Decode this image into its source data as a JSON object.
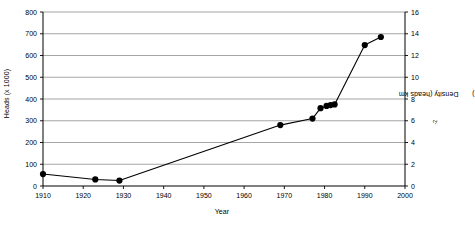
{
  "chart_data": {
    "type": "line",
    "title": "",
    "xlabel": "Year",
    "ylabel": "Heads (x 1000)",
    "y2label": "Density (heads km-2)",
    "y2label_prefix": "Density (heads km",
    "y2label_exponent": "-2",
    "y2label_suffix": ")",
    "xlim": [
      1910,
      2000
    ],
    "ylim": [
      0,
      800
    ],
    "y2lim": [
      0,
      16
    ],
    "grid": true,
    "legend": null,
    "xticks": [
      1910,
      1920,
      1930,
      1940,
      1950,
      1960,
      1970,
      1980,
      1990,
      2000
    ],
    "xticklabels": [
      "1910",
      "1920",
      "1930",
      "1940",
      "1950",
      "1960",
      "1970",
      "1980",
      "1990",
      "2000"
    ],
    "yticks": [
      0,
      100,
      200,
      300,
      400,
      500,
      600,
      700,
      800
    ],
    "yticklabels": [
      "0",
      "100",
      "200",
      "300",
      "400",
      "500",
      "600",
      "700",
      "800"
    ],
    "y2ticks": [
      0,
      2,
      4,
      6,
      8,
      10,
      12,
      14,
      16
    ],
    "y2ticklabels": [
      "0",
      "2",
      "4",
      "6",
      "8",
      "10",
      "12",
      "14",
      "16"
    ],
    "marker": "filled-circle",
    "marker_color": "#000000",
    "line_color": "#000000",
    "grid_color": "#808080",
    "axis_color": "#000000",
    "x": [
      1910,
      1923,
      1929,
      1969,
      1977,
      1979,
      1980.5,
      1981.5,
      1982.5,
      1990,
      1994
    ],
    "values": [
      55,
      30,
      25,
      280,
      310,
      358,
      368,
      372,
      375,
      648,
      685
    ],
    "series": [
      {
        "name": "Heads",
        "points": [
          {
            "year": 1910,
            "heads": 55,
            "density": 1.1
          },
          {
            "year": 1923,
            "heads": 30,
            "density": 0.6
          },
          {
            "year": 1929,
            "heads": 25,
            "density": 0.5
          },
          {
            "year": 1969,
            "heads": 280,
            "density": 5.6
          },
          {
            "year": 1977,
            "heads": 310,
            "density": 6.2
          },
          {
            "year": 1979,
            "heads": 358,
            "density": 7.16
          },
          {
            "year": 1980.5,
            "heads": 368,
            "density": 7.36
          },
          {
            "year": 1981.5,
            "heads": 372,
            "density": 7.44
          },
          {
            "year": 1982.5,
            "heads": 375,
            "density": 7.5
          },
          {
            "year": 1990,
            "heads": 648,
            "density": 12.96
          },
          {
            "year": 1994,
            "heads": 685,
            "density": 13.7
          }
        ]
      }
    ]
  }
}
